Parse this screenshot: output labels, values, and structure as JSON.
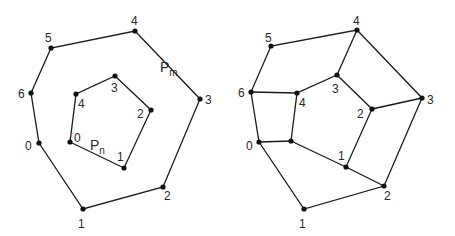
{
  "left_figure": {
    "outer_polygon": {
      "name": "P",
      "subscript": "m",
      "label_pos": [
        160,
        72
      ],
      "vertices": [
        {
          "id": "0",
          "x": 39,
          "y": 143,
          "lx": 25,
          "ly": 150
        },
        {
          "id": "1",
          "x": 83,
          "y": 209,
          "lx": 78,
          "ly": 228
        },
        {
          "id": "2",
          "x": 163,
          "y": 187,
          "lx": 164,
          "ly": 200
        },
        {
          "id": "3",
          "x": 200,
          "y": 99,
          "lx": 205,
          "ly": 104
        },
        {
          "id": "4",
          "x": 135,
          "y": 31,
          "lx": 131,
          "ly": 25
        },
        {
          "id": "5",
          "x": 51,
          "y": 48,
          "lx": 45,
          "ly": 42
        },
        {
          "id": "6",
          "x": 31,
          "y": 93,
          "lx": 18,
          "ly": 98
        }
      ]
    },
    "inner_polygon": {
      "name": "P",
      "subscript": "n",
      "label_pos": [
        90,
        150
      ],
      "vertices": [
        {
          "id": "0",
          "x": 70,
          "y": 142,
          "lx": 74,
          "ly": 142
        },
        {
          "id": "1",
          "x": 124,
          "y": 168,
          "lx": 117,
          "ly": 161
        },
        {
          "id": "2",
          "x": 151,
          "y": 110,
          "lx": 137,
          "ly": 118
        },
        {
          "id": "3",
          "x": 115,
          "y": 76,
          "lx": 111,
          "ly": 92
        },
        {
          "id": "4",
          "x": 76,
          "y": 94,
          "lx": 78,
          "ly": 108
        }
      ]
    }
  },
  "right_figure": {
    "outer_polygon": {
      "vertices": [
        {
          "id": "0",
          "x": 259,
          "y": 142,
          "lx": 246,
          "ly": 150
        },
        {
          "id": "1",
          "x": 304,
          "y": 209,
          "lx": 299,
          "ly": 228
        },
        {
          "id": "2",
          "x": 384,
          "y": 186,
          "lx": 384,
          "ly": 200
        },
        {
          "id": "3",
          "x": 422,
          "y": 98,
          "lx": 427,
          "ly": 104
        },
        {
          "id": "4",
          "x": 357,
          "y": 30,
          "lx": 353,
          "ly": 25
        },
        {
          "id": "5",
          "x": 271,
          "y": 46,
          "lx": 265,
          "ly": 42
        },
        {
          "id": "6",
          "x": 251,
          "y": 92,
          "lx": 238,
          "ly": 97
        }
      ]
    },
    "inner_polygon": {
      "vertices": [
        {
          "id": "0",
          "x": 291,
          "y": 141,
          "lx": null,
          "ly": null
        },
        {
          "id": "1",
          "x": 346,
          "y": 167,
          "lx": 338,
          "ly": 160
        },
        {
          "id": "2",
          "x": 372,
          "y": 109,
          "lx": 357,
          "ly": 118
        },
        {
          "id": "3",
          "x": 337,
          "y": 75,
          "lx": 332,
          "ly": 93
        },
        {
          "id": "4",
          "x": 297,
          "y": 93,
          "lx": 299,
          "ly": 107
        }
      ]
    },
    "connections": [
      {
        "inner": "4",
        "outer": "6"
      },
      {
        "inner": "0",
        "outer": "0"
      },
      {
        "inner": "1",
        "outer": "2"
      },
      {
        "inner": "2",
        "outer": "3"
      },
      {
        "inner": "3",
        "outer": "4"
      }
    ]
  },
  "style": {
    "line_color": "#1a1a1a",
    "vertex_color": "#111111",
    "label_color": "#2a2a2a",
    "background": "#ffffff"
  }
}
